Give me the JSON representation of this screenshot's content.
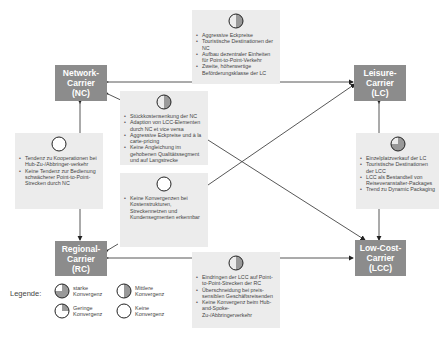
{
  "carriers": {
    "nc": {
      "line1": "Network-",
      "line2": "Carrier",
      "line3": "(NC)"
    },
    "lc": {
      "line1": "Leisure-",
      "line2": "Carrier",
      "line3": "(LC)"
    },
    "rc": {
      "line1": "Regional-",
      "line2": "Carrier",
      "line3": "(RC)"
    },
    "lcc": {
      "line1": "Low-Cost-",
      "line2": "Carrier",
      "line3": "(LCC)"
    }
  },
  "boxes": {
    "nc_lc": {
      "convergence": "mittlere",
      "items": [
        "Aggressive Eckpreise",
        "Touristische Destinationen der NC",
        "Aufbau dezentraler Einheiten für Point-to-Point-Verkehr",
        "Zweite, höherwertige Beförderungsklasse der LC"
      ]
    },
    "nc_lcc": {
      "convergence": "mittlere",
      "items": [
        "Stückkostensenkung der NC",
        "Adaption von LCC-Elementen durch NC et vice versa",
        "Aggressive Eckpreise und à la carte-pricing",
        "Keine Angleichung im gehobenen Qualitätssegment und auf Langstrecke"
      ]
    },
    "nc_rc": {
      "convergence": "keine",
      "items": [
        "Tendenz zu Kooperationen bei Hub-Zu-/Abbringer-verkehr",
        "Keine Tendenz zur Bedienung schwächerer Point-to-Point-Strecken durch NC"
      ]
    },
    "lc_rc": {
      "convergence": "keine",
      "items": [
        "Keine Konvergenzen bei Kostenstrukturen, Streckennetzen und Kundensegmenten erkennbar"
      ]
    },
    "lc_lcc": {
      "convergence": "starke",
      "items": [
        "Einzelplatzverkauf der LC",
        "Touristische Destinationen der LCC",
        "LCC als Bestandteil von Reiseveranstalter-Packages",
        "Trend zu Dynamic Packaging"
      ]
    },
    "rc_lcc": {
      "convergence": "mittlere",
      "items": [
        "Eindringen der LCC auf Point-to-Point-Strecken der RC",
        "Überschneidung bei preis-sensiblen Geschäftsreisenden",
        "Keine Konvergenz beim Hub-and-Spoke-Zu-/Abbringerverkehr"
      ]
    }
  },
  "legend": {
    "title": "Legende:",
    "starke": {
      "line1": "starke",
      "line2": "Konvergenz"
    },
    "mittlere": {
      "line1": "Mittlere",
      "line2": "Konvergenz"
    },
    "geringe": {
      "line1": "Geringe",
      "line2": "Konvergenz"
    },
    "keine": {
      "line1": "Keine",
      "line2": "Konvergenz"
    }
  },
  "colors": {
    "carrier_fill": "#8c8c8c",
    "box_fill": "#ececec",
    "symbol_fill": "#999999",
    "line": "#333333"
  }
}
